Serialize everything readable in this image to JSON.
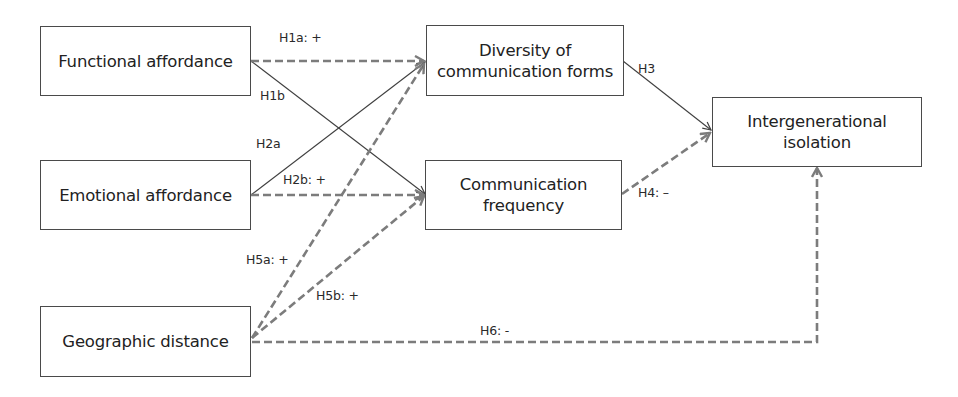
{
  "diagram": {
    "type": "path-model",
    "nodes": [
      {
        "id": "functional",
        "label": "Functional affordance"
      },
      {
        "id": "emotional",
        "label": "Emotional affordance"
      },
      {
        "id": "geographic",
        "label": "Geographic distance"
      },
      {
        "id": "diversity",
        "label_line1": "Diversity of",
        "label_line2": "communication forms"
      },
      {
        "id": "frequency",
        "label_line1": "Communication",
        "label_line2": "frequency"
      },
      {
        "id": "isolation",
        "label_line1": "Intergenerational",
        "label_line2": "isolation"
      }
    ],
    "edges": [
      {
        "id": "H1a",
        "label": "H1a: +",
        "from": "Functional affordance",
        "to": "Diversity of communication forms",
        "style": "dashed"
      },
      {
        "id": "H1b",
        "label": "H1b",
        "from": "Functional affordance",
        "to": "Communication frequency",
        "style": "solid"
      },
      {
        "id": "H2a",
        "label": "H2a",
        "from": "Emotional affordance",
        "to": "Diversity of communication forms",
        "style": "solid"
      },
      {
        "id": "H2b",
        "label": "H2b: +",
        "from": "Emotional affordance",
        "to": "Communication frequency",
        "style": "dashed"
      },
      {
        "id": "H3",
        "label": "H3",
        "from": "Diversity of communication forms",
        "to": "Intergenerational isolation",
        "style": "solid"
      },
      {
        "id": "H4",
        "label": "H4: –",
        "from": "Communication frequency",
        "to": "Intergenerational isolation",
        "style": "dashed"
      },
      {
        "id": "H5a",
        "label": "H5a: +",
        "from": "Geographic distance",
        "to": "Diversity of communication forms",
        "style": "dashed"
      },
      {
        "id": "H5b",
        "label": "H5b: +",
        "from": "Geographic distance",
        "to": "Communication frequency",
        "style": "dashed"
      },
      {
        "id": "H6",
        "label": "H6: -",
        "from": "Geographic distance",
        "to": "Intergenerational isolation",
        "style": "dashed"
      }
    ],
    "colors": {
      "solid_line": "#3f3f3f",
      "dashed_line": "#7c7c7c",
      "box_border": "#4a4a4a"
    }
  }
}
